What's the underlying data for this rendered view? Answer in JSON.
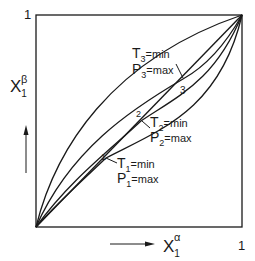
{
  "figure": {
    "axes": {
      "y_label_main": "X",
      "y_label_sub": "1",
      "y_label_sup": "β",
      "x_label_main": "X",
      "x_label_sub": "1",
      "x_label_sup": "α",
      "y_max_tick": "1",
      "x_max_tick": "1"
    },
    "points": [
      {
        "id": "1",
        "label": "1",
        "t_main": "T",
        "t_sub": "1",
        "t_rest": "=min",
        "p_main": "P",
        "p_sub": "1",
        "p_rest": "=max"
      },
      {
        "id": "2",
        "label": "2",
        "t_main": "T",
        "t_sub": "2",
        "t_rest": "=min",
        "p_main": "P",
        "p_sub": "2",
        "p_rest": "=max"
      },
      {
        "id": "3",
        "label": "3",
        "t_main": "T",
        "t_sub": "3",
        "t_rest": "=min",
        "p_main": "P",
        "p_sub": "3",
        "p_rest": "=max"
      }
    ],
    "colors": {
      "ink": "#1a1a1a",
      "background": "#ffffff"
    }
  }
}
